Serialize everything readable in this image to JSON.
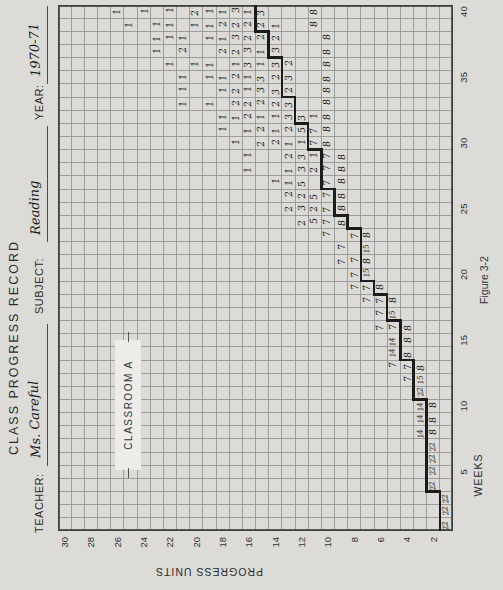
{
  "header": {
    "title": "CLASS PROGRESS RECORD",
    "teacher_label": "TEACHER:",
    "teacher_value": "Ms. Careful",
    "subject_label": "SUBJECT:",
    "subject_value": "Reading",
    "year_label": "YEAR:",
    "year_value": "1970-71"
  },
  "classroom_box": {
    "label": "CLASSROOM A"
  },
  "figure_caption": "Figure 3-2",
  "colors": {
    "paper": "#dcdbd7",
    "grid_line": "#8d8d8d",
    "grid_border": "#3f3f3f",
    "pace_line": "#1c1c1c",
    "ink": "#161616"
  },
  "chart_data": {
    "type": "heatmap",
    "title": "CLASS PROGRESS RECORD",
    "xlabel": "WEEKS",
    "ylabel": "PROGRESS UNITS",
    "x_range": [
      1,
      40
    ],
    "y_range": [
      1,
      30
    ],
    "x_ticks": [
      5,
      10,
      15,
      20,
      25,
      30,
      35,
      40
    ],
    "y_ticks": [
      30,
      28,
      26,
      24,
      22,
      20,
      18,
      16,
      14,
      12,
      10,
      8,
      6,
      4,
      2
    ],
    "grid": true,
    "marks_format": "[week, progress_unit, students_count] handwritten in each grid cell",
    "marks": [
      [
        1,
        1,
        22
      ],
      [
        2,
        1,
        22
      ],
      [
        3,
        1,
        22
      ],
      [
        4,
        2,
        22
      ],
      [
        5,
        2,
        22
      ],
      [
        6,
        2,
        22
      ],
      [
        7,
        2,
        22
      ],
      [
        8,
        3,
        14
      ],
      [
        8,
        2,
        8
      ],
      [
        9,
        3,
        14
      ],
      [
        9,
        2,
        8
      ],
      [
        10,
        3,
        14
      ],
      [
        10,
        2,
        8
      ],
      [
        11,
        3,
        22
      ],
      [
        12,
        4,
        7
      ],
      [
        12,
        3,
        15
      ],
      [
        13,
        5,
        7
      ],
      [
        13,
        4,
        7
      ],
      [
        13,
        3,
        8
      ],
      [
        14,
        5,
        14
      ],
      [
        14,
        4,
        8
      ],
      [
        15,
        5,
        14
      ],
      [
        15,
        4,
        8
      ],
      [
        16,
        6,
        7
      ],
      [
        16,
        5,
        7
      ],
      [
        16,
        4,
        8
      ],
      [
        17,
        6,
        7
      ],
      [
        17,
        5,
        15
      ],
      [
        18,
        7,
        7
      ],
      [
        18,
        6,
        7
      ],
      [
        18,
        5,
        8
      ],
      [
        19,
        8,
        7
      ],
      [
        19,
        7,
        7
      ],
      [
        19,
        6,
        8
      ],
      [
        20,
        8,
        7
      ],
      [
        20,
        7,
        15
      ],
      [
        21,
        9,
        7
      ],
      [
        21,
        8,
        7
      ],
      [
        21,
        7,
        8
      ],
      [
        22,
        9,
        7
      ],
      [
        22,
        7,
        15
      ],
      [
        23,
        10,
        7
      ],
      [
        23,
        8,
        7
      ],
      [
        23,
        7,
        8
      ],
      [
        24,
        12,
        2
      ],
      [
        24,
        11,
        5
      ],
      [
        24,
        10,
        7
      ],
      [
        24,
        9,
        8
      ],
      [
        25,
        13,
        2
      ],
      [
        25,
        12,
        3
      ],
      [
        25,
        11,
        2
      ],
      [
        25,
        10,
        7
      ],
      [
        25,
        9,
        8
      ],
      [
        26,
        13,
        2
      ],
      [
        26,
        12,
        2
      ],
      [
        26,
        11,
        5
      ],
      [
        26,
        10,
        7
      ],
      [
        26,
        9,
        8
      ],
      [
        27,
        14,
        1
      ],
      [
        27,
        13,
        1
      ],
      [
        27,
        12,
        5
      ],
      [
        27,
        10,
        7
      ],
      [
        27,
        9,
        8
      ],
      [
        28,
        16,
        1
      ],
      [
        28,
        13,
        1
      ],
      [
        28,
        12,
        3
      ],
      [
        28,
        11,
        2
      ],
      [
        28,
        10,
        7
      ],
      [
        28,
        9,
        8
      ],
      [
        29,
        16,
        1
      ],
      [
        29,
        13,
        2
      ],
      [
        29,
        12,
        3
      ],
      [
        29,
        11,
        1
      ],
      [
        29,
        10,
        7
      ],
      [
        29,
        9,
        8
      ],
      [
        30,
        17,
        1
      ],
      [
        30,
        15,
        2
      ],
      [
        30,
        14,
        2
      ],
      [
        30,
        13,
        1
      ],
      [
        30,
        12,
        1
      ],
      [
        30,
        11,
        7
      ],
      [
        30,
        10,
        8
      ],
      [
        31,
        18,
        1
      ],
      [
        31,
        16,
        1
      ],
      [
        31,
        15,
        2
      ],
      [
        31,
        14,
        1
      ],
      [
        31,
        13,
        2
      ],
      [
        31,
        12,
        5
      ],
      [
        31,
        11,
        7
      ],
      [
        31,
        10,
        8
      ],
      [
        32,
        18,
        1
      ],
      [
        32,
        17,
        1
      ],
      [
        32,
        16,
        2
      ],
      [
        32,
        15,
        1
      ],
      [
        32,
        14,
        1
      ],
      [
        32,
        13,
        3
      ],
      [
        32,
        12,
        3
      ],
      [
        32,
        11,
        1
      ],
      [
        32,
        10,
        8
      ],
      [
        33,
        21,
        1
      ],
      [
        33,
        19,
        1
      ],
      [
        33,
        17,
        2
      ],
      [
        33,
        16,
        2
      ],
      [
        33,
        15,
        2
      ],
      [
        33,
        14,
        2
      ],
      [
        33,
        13,
        3
      ],
      [
        33,
        10,
        8
      ],
      [
        34,
        21,
        1
      ],
      [
        34,
        18,
        1
      ],
      [
        34,
        17,
        2
      ],
      [
        34,
        16,
        1
      ],
      [
        34,
        15,
        3
      ],
      [
        34,
        14,
        3
      ],
      [
        34,
        13,
        2
      ],
      [
        34,
        10,
        8
      ],
      [
        35,
        21,
        1
      ],
      [
        35,
        19,
        1
      ],
      [
        35,
        18,
        1
      ],
      [
        35,
        17,
        2
      ],
      [
        35,
        16,
        1
      ],
      [
        35,
        15,
        3
      ],
      [
        35,
        14,
        2
      ],
      [
        35,
        13,
        3
      ],
      [
        35,
        10,
        8
      ],
      [
        36,
        22,
        1
      ],
      [
        36,
        20,
        1
      ],
      [
        36,
        19,
        1
      ],
      [
        36,
        17,
        1
      ],
      [
        36,
        16,
        3
      ],
      [
        36,
        15,
        1
      ],
      [
        36,
        14,
        3
      ],
      [
        36,
        13,
        2
      ],
      [
        36,
        10,
        8
      ],
      [
        37,
        23,
        1
      ],
      [
        37,
        21,
        2
      ],
      [
        37,
        18,
        2
      ],
      [
        37,
        17,
        2
      ],
      [
        37,
        16,
        3
      ],
      [
        37,
        15,
        1
      ],
      [
        37,
        14,
        3
      ],
      [
        37,
        10,
        8
      ],
      [
        38,
        23,
        1
      ],
      [
        38,
        22,
        1
      ],
      [
        38,
        21,
        1
      ],
      [
        38,
        19,
        1
      ],
      [
        38,
        18,
        1
      ],
      [
        38,
        17,
        3
      ],
      [
        38,
        16,
        2
      ],
      [
        38,
        15,
        2
      ],
      [
        38,
        14,
        2
      ],
      [
        38,
        10,
        8
      ],
      [
        39,
        25,
        1
      ],
      [
        39,
        23,
        1
      ],
      [
        39,
        22,
        1
      ],
      [
        39,
        20,
        1
      ],
      [
        39,
        19,
        1
      ],
      [
        39,
        18,
        2
      ],
      [
        39,
        17,
        2
      ],
      [
        39,
        16,
        2
      ],
      [
        39,
        15,
        2
      ],
      [
        39,
        14,
        1
      ],
      [
        39,
        11,
        8
      ],
      [
        40,
        26,
        1
      ],
      [
        40,
        24,
        1
      ],
      [
        40,
        22,
        1
      ],
      [
        40,
        20,
        2
      ],
      [
        40,
        19,
        1
      ],
      [
        40,
        18,
        1
      ],
      [
        40,
        17,
        3
      ],
      [
        40,
        16,
        1
      ],
      [
        40,
        15,
        3
      ],
      [
        40,
        11,
        8
      ]
    ],
    "pace_line_format": "[unit, from_week, to_week] heavy stepped line drawn along top edge of that unit row",
    "pace_line": [
      [
        1,
        1,
        3
      ],
      [
        2,
        4,
        10
      ],
      [
        3,
        11,
        13
      ],
      [
        4,
        14,
        16
      ],
      [
        5,
        17,
        18
      ],
      [
        6,
        19,
        19
      ],
      [
        7,
        20,
        23
      ],
      [
        8,
        24,
        24
      ],
      [
        9,
        25,
        26
      ],
      [
        10,
        27,
        29
      ],
      [
        11,
        30,
        31
      ],
      [
        12,
        32,
        33
      ],
      [
        13,
        34,
        36
      ],
      [
        14,
        37,
        38
      ],
      [
        15,
        39,
        40
      ]
    ]
  }
}
